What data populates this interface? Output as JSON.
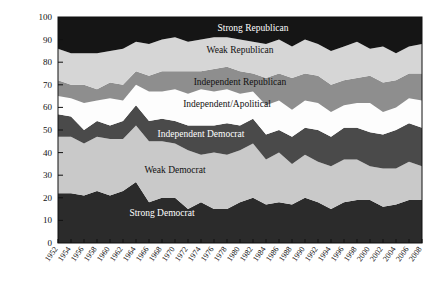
{
  "chart_data": {
    "type": "area",
    "title": "",
    "subtitle": "",
    "xlabel": "",
    "ylabel": "",
    "ylim": [
      0,
      100
    ],
    "grid": false,
    "legend_position": "inline-labels",
    "stacked": true,
    "normalized_percent": true,
    "x": [
      1952,
      1954,
      1956,
      1958,
      1960,
      1962,
      1964,
      1966,
      1968,
      1970,
      1972,
      1974,
      1976,
      1978,
      1980,
      1982,
      1984,
      1986,
      1988,
      1990,
      1992,
      1994,
      1996,
      1998,
      2000,
      2002,
      2004,
      2006,
      2008
    ],
    "xtick_labels": [
      "1952",
      "1954",
      "1956",
      "1958",
      "1960",
      "1962",
      "1964",
      "1966",
      "1968",
      "1970",
      "1972",
      "1974",
      "1976",
      "1978",
      "1980",
      "1982",
      "1984",
      "1986",
      "1988",
      "1990",
      "1992",
      "1994",
      "1996",
      "1998",
      "2000",
      "2002",
      "2004",
      "2006",
      "2008"
    ],
    "ytick_labels": [
      "0",
      "10",
      "20",
      "30",
      "40",
      "50",
      "60",
      "70",
      "80",
      "90",
      "100"
    ],
    "ytick_values": [
      0,
      10,
      20,
      30,
      40,
      50,
      60,
      70,
      80,
      90,
      100
    ],
    "series": [
      {
        "name": "Strong Democrat",
        "color": "#2b2b2b",
        "label_color": "#ffffff",
        "values": [
          22,
          22,
          21,
          23,
          21,
          23,
          27,
          18,
          20,
          20,
          15,
          18,
          15,
          15,
          18,
          20,
          17,
          18,
          17,
          20,
          18,
          15,
          18,
          19,
          19,
          16,
          17,
          19,
          19
        ]
      },
      {
        "name": "Weak Democrat",
        "color": "#c9c9c9",
        "label_color": "#111111",
        "values": [
          25,
          25,
          23,
          24,
          25,
          23,
          25,
          27,
          25,
          24,
          26,
          21,
          25,
          24,
          23,
          24,
          20,
          22,
          18,
          19,
          18,
          19,
          19,
          18,
          15,
          17,
          16,
          17,
          15
        ]
      },
      {
        "name": "Independent Democrat",
        "color": "#4a4a4a",
        "label_color": "#ffffff",
        "values": [
          10,
          9,
          6,
          7,
          6,
          8,
          9,
          9,
          10,
          10,
          11,
          13,
          12,
          14,
          11,
          11,
          11,
          10,
          12,
          12,
          14,
          13,
          14,
          14,
          15,
          15,
          17,
          17,
          17
        ]
      },
      {
        "name": "Independent/Apolitical",
        "color": "#fdfdfd",
        "label_color": "#111111",
        "values": [
          8,
          8,
          12,
          9,
          12,
          9,
          9,
          13,
          12,
          14,
          14,
          16,
          15,
          15,
          14,
          12,
          13,
          13,
          12,
          12,
          12,
          11,
          10,
          11,
          13,
          10,
          10,
          11,
          12
        ]
      },
      {
        "name": "Independent Republican",
        "color": "#8e8e8e",
        "label_color": "#111111",
        "values": [
          7,
          6,
          8,
          5,
          7,
          7,
          6,
          7,
          9,
          8,
          10,
          8,
          10,
          10,
          10,
          8,
          12,
          12,
          14,
          12,
          12,
          12,
          11,
          11,
          12,
          13,
          12,
          11,
          12
        ]
      },
      {
        "name": "Weak Republican",
        "color": "#d6d6d6",
        "label_color": "#111111",
        "values": [
          14,
          14,
          14,
          16,
          14,
          16,
          13,
          14,
          14,
          15,
          13,
          14,
          14,
          13,
          14,
          14,
          15,
          15,
          14,
          15,
          14,
          15,
          15,
          16,
          12,
          16,
          12,
          12,
          13
        ]
      },
      {
        "name": "Strong Republican",
        "color": "#151515",
        "label_color": "#ffffff",
        "values": [
          14,
          16,
          16,
          16,
          15,
          14,
          11,
          12,
          10,
          9,
          11,
          10,
          9,
          9,
          10,
          11,
          12,
          10,
          13,
          10,
          12,
          15,
          13,
          11,
          14,
          13,
          16,
          13,
          12
        ]
      }
    ],
    "series_label_anchors": [
      {
        "name": "Strong Republican",
        "x_year": 1982,
        "y_value": 94
      },
      {
        "name": "Weak Republican",
        "x_year": 1980,
        "y_value": 84
      },
      {
        "name": "Independent Republican",
        "x_year": 1980,
        "y_value": 70
      },
      {
        "name": "Independent/Apolitical",
        "x_year": 1978,
        "y_value": 60
      },
      {
        "name": "Independent Democrat",
        "x_year": 1974,
        "y_value": 47
      },
      {
        "name": "Weak Democrat",
        "x_year": 1970,
        "y_value": 31
      },
      {
        "name": "Strong Democrat",
        "x_year": 1968,
        "y_value": 12
      }
    ]
  }
}
